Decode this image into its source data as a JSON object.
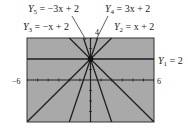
{
  "chart_data": {
    "type": "line",
    "title": "",
    "xlabel": "",
    "ylabel": "",
    "xlim": [
      -6,
      6
    ],
    "ylim": [
      -4,
      4
    ],
    "grid": false,
    "tick_labels": {
      "xmin": "-6",
      "xmax": "6",
      "ymax": "4"
    },
    "series": [
      {
        "name": "Y1",
        "label": "Y1 = 2",
        "slope": 0,
        "intercept": 2
      },
      {
        "name": "Y2",
        "label": "Y2 = x + 2",
        "slope": 1,
        "intercept": 2
      },
      {
        "name": "Y3",
        "label": "Y3 = -x + 2",
        "slope": -1,
        "intercept": 2
      },
      {
        "name": "Y4",
        "label": "Y4 = 3x + 2",
        "slope": 3,
        "intercept": 2
      },
      {
        "name": "Y5",
        "label": "Y5 = -3x + 2",
        "slope": -3,
        "intercept": 2
      }
    ],
    "common_point": [
      0,
      2
    ],
    "background_color": "#a9a9a9",
    "line_color": "#1e1e1e"
  },
  "labels": {
    "y5": {
      "name": "Y",
      "sub": "5",
      "rest": " = −3x + 2"
    },
    "y4": {
      "name": "Y",
      "sub": "4",
      "rest": " = 3x + 2"
    },
    "y3": {
      "name": "Y",
      "sub": "3",
      "rest": " = −x + 2"
    },
    "y2": {
      "name": "Y",
      "sub": "2",
      "rest": " = x + 2"
    },
    "y1": {
      "name": "Y",
      "sub": "1",
      "rest": " = 2"
    },
    "ymax": "4",
    "xmin": "−6",
    "xmax": "6"
  }
}
